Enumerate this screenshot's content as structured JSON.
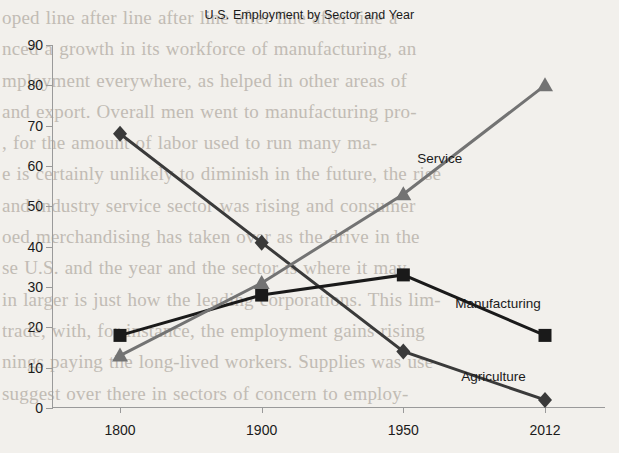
{
  "chart_data": {
    "type": "line",
    "title": "U.S. Employment by Sector and Year",
    "xlabel": "",
    "ylabel": "",
    "categories": [
      "1800",
      "1900",
      "1950",
      "2012"
    ],
    "ylim": [
      0,
      90
    ],
    "yticks": [
      0,
      10,
      20,
      30,
      40,
      50,
      60,
      70,
      80,
      90
    ],
    "grid": false,
    "legend_position": "inline-end-of-line",
    "series": [
      {
        "name": "Agriculture",
        "values": [
          68,
          41,
          14,
          2
        ],
        "color": "#3a3a3a",
        "marker": "diamond"
      },
      {
        "name": "Manufacturing",
        "values": [
          18,
          28,
          33,
          18
        ],
        "color": "#1a1a1a",
        "marker": "square"
      },
      {
        "name": "Service",
        "values": [
          13,
          31,
          53,
          80
        ],
        "color": "#737373",
        "marker": "triangle"
      }
    ],
    "annotations": [
      {
        "text": "Service",
        "series": "Service"
      },
      {
        "text": "Manufacturing",
        "series": "Manufacturing"
      },
      {
        "text": "Agriculture",
        "series": "Agriculture"
      }
    ]
  },
  "page_background_text": "oped line after line after line after line after line a\nnced a growth in its workforce of manufacturing, an\nmployment everywhere, as helped in other areas of\nand export. Overall men went to manufacturing pro-\n, for the amount of labor used to run many ma-\ne is certainly unlikely to diminish in the future, the rise\nand industry service sector was rising and consumer\noed merchandising has taken over as the drive in the\nse U.S. and the year and the sector is where it may\nin larger is just how the leading corporations. This lim-\ntrade, with, for instance, the employment gains rising\nnings paying the long-lived workers. Supplies was use\nsuggest over there in sectors of concern to employ-\n"
}
